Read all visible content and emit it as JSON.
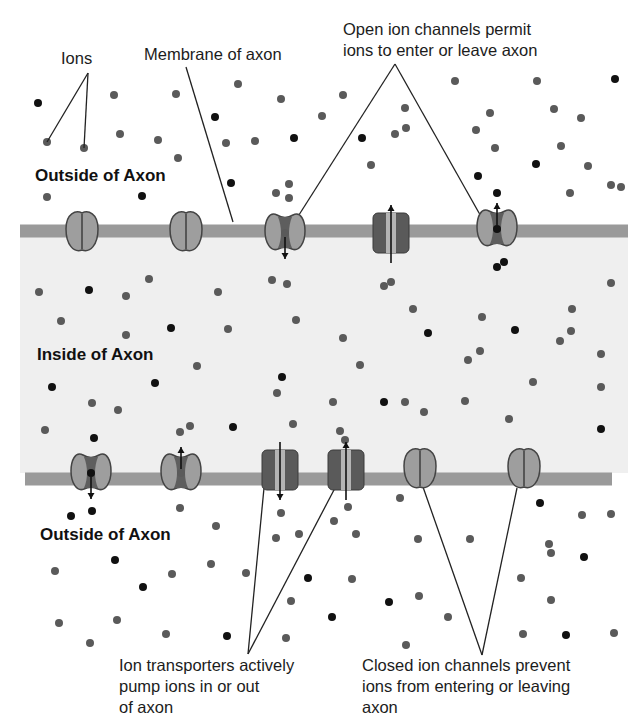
{
  "diagram": {
    "colors": {
      "background": "#ffffff",
      "inside_fill": "#efefef",
      "membrane": "#9a9a9a",
      "channel_light": "#9e9e9e",
      "channel_dark": "#5e5e5e",
      "channel_outline": "#444444",
      "transporter_body": "#5a5a5a",
      "transporter_stripe": "#b4b4b4",
      "ion_gray": "#5a5a5a",
      "ion_black": "#111111",
      "line": "#222222"
    },
    "regions": {
      "outside_top": "Outside of Axon",
      "inside": "Inside of Axon",
      "outside_bottom": "Outside of Axon"
    },
    "labels": {
      "ions": "Ions",
      "membrane": "Membrane of axon",
      "open_channels": [
        "Open ion channels permit",
        "ions to enter or leave axon"
      ],
      "transporters": [
        "Ion transporters actively",
        "pump ions in or out",
        "of axon"
      ],
      "closed_channels": [
        "Closed ion channels prevent",
        "ions from entering or leaving",
        "axon"
      ]
    },
    "membranes": [
      {
        "name": "upper-membrane",
        "y": 231,
        "x1": 20,
        "x2": 628,
        "thickness": 13
      },
      {
        "name": "lower-membrane",
        "y": 479,
        "x1": 25,
        "x2": 612,
        "thickness": 13
      }
    ],
    "proteins": [
      {
        "type": "closed-channel",
        "x": 82,
        "y": 233
      },
      {
        "type": "closed-channel",
        "x": 186,
        "y": 233
      },
      {
        "type": "open-channel",
        "x": 285,
        "y": 233,
        "ion": "gray",
        "arrow": "down"
      },
      {
        "type": "transporter",
        "x": 391,
        "y": 233,
        "arrow": "up"
      },
      {
        "type": "open-channel",
        "x": 497,
        "y": 229,
        "ion": "black",
        "arrow": "up"
      },
      {
        "type": "open-channel",
        "x": 91,
        "y": 473,
        "ion": "black",
        "arrow": "down"
      },
      {
        "type": "open-channel",
        "x": 181,
        "y": 473,
        "ion": "gray",
        "arrow": "up"
      },
      {
        "type": "transporter",
        "x": 280,
        "y": 470,
        "arrow": "down"
      },
      {
        "type": "transporter",
        "x": 346,
        "y": 470,
        "arrow": "up"
      },
      {
        "type": "closed-channel",
        "x": 420,
        "y": 470
      },
      {
        "type": "closed-channel",
        "x": 524,
        "y": 470
      }
    ],
    "ions": [
      {
        "x": 38,
        "y": 103,
        "c": "black"
      },
      {
        "x": 47,
        "y": 142,
        "c": "gray"
      },
      {
        "x": 84,
        "y": 148,
        "c": "gray"
      },
      {
        "x": 114,
        "y": 95,
        "c": "gray"
      },
      {
        "x": 120,
        "y": 134,
        "c": "gray"
      },
      {
        "x": 158,
        "y": 140,
        "c": "gray"
      },
      {
        "x": 176,
        "y": 94,
        "c": "gray"
      },
      {
        "x": 178,
        "y": 158,
        "c": "gray"
      },
      {
        "x": 215,
        "y": 117,
        "c": "black"
      },
      {
        "x": 226,
        "y": 143,
        "c": "gray"
      },
      {
        "x": 238,
        "y": 84,
        "c": "gray"
      },
      {
        "x": 231,
        "y": 183,
        "c": "black"
      },
      {
        "x": 47,
        "y": 197,
        "c": "gray"
      },
      {
        "x": 142,
        "y": 196,
        "c": "black"
      },
      {
        "x": 255,
        "y": 141,
        "c": "gray"
      },
      {
        "x": 281,
        "y": 99,
        "c": "gray"
      },
      {
        "x": 294,
        "y": 138,
        "c": "black"
      },
      {
        "x": 289,
        "y": 184,
        "c": "gray"
      },
      {
        "x": 276,
        "y": 193,
        "c": "gray"
      },
      {
        "x": 289,
        "y": 198,
        "c": "gray"
      },
      {
        "x": 343,
        "y": 95,
        "c": "gray"
      },
      {
        "x": 322,
        "y": 116,
        "c": "gray"
      },
      {
        "x": 362,
        "y": 138,
        "c": "black"
      },
      {
        "x": 371,
        "y": 165,
        "c": "gray"
      },
      {
        "x": 405,
        "y": 108,
        "c": "gray"
      },
      {
        "x": 406,
        "y": 128,
        "c": "gray"
      },
      {
        "x": 395,
        "y": 134,
        "c": "gray"
      },
      {
        "x": 476,
        "y": 130,
        "c": "gray"
      },
      {
        "x": 455,
        "y": 81,
        "c": "gray"
      },
      {
        "x": 537,
        "y": 81,
        "c": "gray"
      },
      {
        "x": 615,
        "y": 79,
        "c": "black"
      },
      {
        "x": 490,
        "y": 113,
        "c": "gray"
      },
      {
        "x": 554,
        "y": 109,
        "c": "gray"
      },
      {
        "x": 581,
        "y": 118,
        "c": "gray"
      },
      {
        "x": 495,
        "y": 148,
        "c": "gray"
      },
      {
        "x": 561,
        "y": 146,
        "c": "gray"
      },
      {
        "x": 536,
        "y": 164,
        "c": "black"
      },
      {
        "x": 588,
        "y": 166,
        "c": "gray"
      },
      {
        "x": 478,
        "y": 176,
        "c": "black"
      },
      {
        "x": 497,
        "y": 193,
        "c": "black"
      },
      {
        "x": 570,
        "y": 193,
        "c": "gray"
      },
      {
        "x": 611,
        "y": 185,
        "c": "gray"
      },
      {
        "x": 621,
        "y": 187,
        "c": "gray"
      },
      {
        "x": 39,
        "y": 292,
        "c": "gray"
      },
      {
        "x": 89,
        "y": 290,
        "c": "black"
      },
      {
        "x": 149,
        "y": 279,
        "c": "gray"
      },
      {
        "x": 126,
        "y": 296,
        "c": "gray"
      },
      {
        "x": 61,
        "y": 321,
        "c": "gray"
      },
      {
        "x": 126,
        "y": 335,
        "c": "gray"
      },
      {
        "x": 171,
        "y": 328,
        "c": "black"
      },
      {
        "x": 218,
        "y": 292,
        "c": "gray"
      },
      {
        "x": 228,
        "y": 329,
        "c": "gray"
      },
      {
        "x": 272,
        "y": 280,
        "c": "gray"
      },
      {
        "x": 287,
        "y": 284,
        "c": "gray"
      },
      {
        "x": 296,
        "y": 320,
        "c": "gray"
      },
      {
        "x": 282,
        "y": 377,
        "c": "black"
      },
      {
        "x": 197,
        "y": 366,
        "c": "gray"
      },
      {
        "x": 52,
        "y": 387,
        "c": "black"
      },
      {
        "x": 155,
        "y": 383,
        "c": "black"
      },
      {
        "x": 92,
        "y": 403,
        "c": "gray"
      },
      {
        "x": 118,
        "y": 410,
        "c": "gray"
      },
      {
        "x": 45,
        "y": 430,
        "c": "gray"
      },
      {
        "x": 94,
        "y": 438,
        "c": "black"
      },
      {
        "x": 190,
        "y": 426,
        "c": "gray"
      },
      {
        "x": 180,
        "y": 432,
        "c": "gray"
      },
      {
        "x": 233,
        "y": 427,
        "c": "black"
      },
      {
        "x": 277,
        "y": 393,
        "c": "gray"
      },
      {
        "x": 293,
        "y": 424,
        "c": "gray"
      },
      {
        "x": 333,
        "y": 402,
        "c": "gray"
      },
      {
        "x": 340,
        "y": 431,
        "c": "gray"
      },
      {
        "x": 345,
        "y": 440,
        "c": "gray"
      },
      {
        "x": 360,
        "y": 365,
        "c": "gray"
      },
      {
        "x": 384,
        "y": 402,
        "c": "black"
      },
      {
        "x": 384,
        "y": 286,
        "c": "gray"
      },
      {
        "x": 391,
        "y": 282,
        "c": "gray"
      },
      {
        "x": 413,
        "y": 309,
        "c": "gray"
      },
      {
        "x": 428,
        "y": 333,
        "c": "black"
      },
      {
        "x": 343,
        "y": 338,
        "c": "gray"
      },
      {
        "x": 405,
        "y": 402,
        "c": "gray"
      },
      {
        "x": 424,
        "y": 412,
        "c": "gray"
      },
      {
        "x": 465,
        "y": 401,
        "c": "gray"
      },
      {
        "x": 468,
        "y": 360,
        "c": "gray"
      },
      {
        "x": 480,
        "y": 351,
        "c": "gray"
      },
      {
        "x": 497,
        "y": 267,
        "c": "black"
      },
      {
        "x": 504,
        "y": 262,
        "c": "black"
      },
      {
        "x": 515,
        "y": 330,
        "c": "black"
      },
      {
        "x": 482,
        "y": 317,
        "c": "gray"
      },
      {
        "x": 560,
        "y": 341,
        "c": "gray"
      },
      {
        "x": 571,
        "y": 331,
        "c": "gray"
      },
      {
        "x": 601,
        "y": 354,
        "c": "gray"
      },
      {
        "x": 611,
        "y": 283,
        "c": "gray"
      },
      {
        "x": 572,
        "y": 309,
        "c": "gray"
      },
      {
        "x": 533,
        "y": 382,
        "c": "gray"
      },
      {
        "x": 509,
        "y": 419,
        "c": "gray"
      },
      {
        "x": 601,
        "y": 387,
        "c": "gray"
      },
      {
        "x": 601,
        "y": 429,
        "c": "black"
      },
      {
        "x": 71,
        "y": 516,
        "c": "black"
      },
      {
        "x": 92,
        "y": 511,
        "c": "black"
      },
      {
        "x": 180,
        "y": 508,
        "c": "gray"
      },
      {
        "x": 216,
        "y": 526,
        "c": "gray"
      },
      {
        "x": 281,
        "y": 513,
        "c": "gray"
      },
      {
        "x": 276,
        "y": 538,
        "c": "gray"
      },
      {
        "x": 299,
        "y": 534,
        "c": "gray"
      },
      {
        "x": 334,
        "y": 521,
        "c": "gray"
      },
      {
        "x": 348,
        "y": 507,
        "c": "gray"
      },
      {
        "x": 356,
        "y": 534,
        "c": "gray"
      },
      {
        "x": 400,
        "y": 498,
        "c": "gray"
      },
      {
        "x": 418,
        "y": 539,
        "c": "gray"
      },
      {
        "x": 470,
        "y": 539,
        "c": "gray"
      },
      {
        "x": 540,
        "y": 503,
        "c": "black"
      },
      {
        "x": 582,
        "y": 515,
        "c": "gray"
      },
      {
        "x": 611,
        "y": 514,
        "c": "gray"
      },
      {
        "x": 551,
        "y": 553,
        "c": "gray"
      },
      {
        "x": 584,
        "y": 557,
        "c": "black"
      },
      {
        "x": 55,
        "y": 571,
        "c": "gray"
      },
      {
        "x": 115,
        "y": 560,
        "c": "black"
      },
      {
        "x": 172,
        "y": 574,
        "c": "gray"
      },
      {
        "x": 211,
        "y": 564,
        "c": "gray"
      },
      {
        "x": 246,
        "y": 573,
        "c": "gray"
      },
      {
        "x": 308,
        "y": 578,
        "c": "black"
      },
      {
        "x": 352,
        "y": 579,
        "c": "gray"
      },
      {
        "x": 143,
        "y": 587,
        "c": "black"
      },
      {
        "x": 291,
        "y": 601,
        "c": "gray"
      },
      {
        "x": 332,
        "y": 617,
        "c": "black"
      },
      {
        "x": 389,
        "y": 602,
        "c": "black"
      },
      {
        "x": 419,
        "y": 596,
        "c": "gray"
      },
      {
        "x": 448,
        "y": 617,
        "c": "gray"
      },
      {
        "x": 521,
        "y": 578,
        "c": "gray"
      },
      {
        "x": 551,
        "y": 600,
        "c": "gray"
      },
      {
        "x": 59,
        "y": 623,
        "c": "gray"
      },
      {
        "x": 117,
        "y": 620,
        "c": "gray"
      },
      {
        "x": 90,
        "y": 643,
        "c": "gray"
      },
      {
        "x": 166,
        "y": 634,
        "c": "gray"
      },
      {
        "x": 227,
        "y": 636,
        "c": "black"
      },
      {
        "x": 286,
        "y": 638,
        "c": "gray"
      },
      {
        "x": 406,
        "y": 645,
        "c": "gray"
      },
      {
        "x": 523,
        "y": 634,
        "c": "gray"
      },
      {
        "x": 566,
        "y": 635,
        "c": "black"
      },
      {
        "x": 614,
        "y": 633,
        "c": "gray"
      },
      {
        "x": 549,
        "y": 544,
        "c": "gray"
      }
    ],
    "leader_lines": [
      {
        "name": "ions-leader-left",
        "x1": 88,
        "y1": 73,
        "x2": 47,
        "y2": 142
      },
      {
        "name": "ions-leader-right",
        "x1": 88,
        "y1": 73,
        "x2": 84,
        "y2": 148
      },
      {
        "name": "membrane-leader",
        "x1": 186,
        "y1": 67,
        "x2": 233,
        "y2": 222
      },
      {
        "name": "open-channel-leader-left",
        "x1": 395,
        "y1": 64,
        "x2": 297,
        "y2": 218
      },
      {
        "name": "open-channel-leader-right",
        "x1": 395,
        "y1": 64,
        "x2": 483,
        "y2": 220
      },
      {
        "name": "transporter-leader-left",
        "x1": 248,
        "y1": 654,
        "x2": 264,
        "y2": 488
      },
      {
        "name": "transporter-leader-right",
        "x1": 248,
        "y1": 654,
        "x2": 335,
        "y2": 488
      },
      {
        "name": "closed-leader-left",
        "x1": 482,
        "y1": 655,
        "x2": 423,
        "y2": 487
      },
      {
        "name": "closed-leader-right",
        "x1": 482,
        "y1": 655,
        "x2": 517,
        "y2": 488
      }
    ]
  }
}
